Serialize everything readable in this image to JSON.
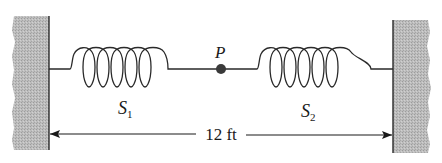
{
  "diagram": {
    "type": "two-spring system between fixed walls",
    "point_label": "P",
    "springs": [
      {
        "id": "S1",
        "label_main": "S",
        "label_sub": "1"
      },
      {
        "id": "S2",
        "label_main": "S",
        "label_sub": "2"
      }
    ],
    "dimension": {
      "label": "12 ft",
      "from": "left-wall",
      "to": "right-wall"
    },
    "colors": {
      "wall_fill": "#b8b8b8",
      "line": "#2a2a2a",
      "point": "#3a3a3a",
      "background": "#ffffff"
    }
  }
}
